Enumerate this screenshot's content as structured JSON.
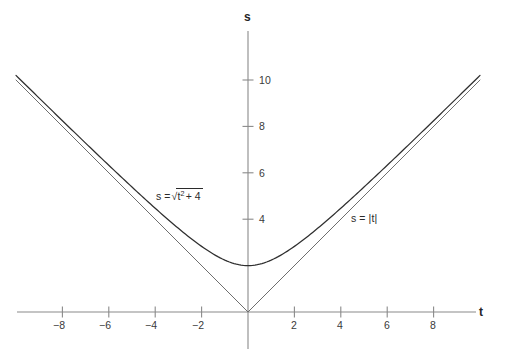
{
  "chart_data": {
    "type": "line",
    "title": "",
    "xlabel": "t",
    "ylabel": "s",
    "xlim": [
      -10,
      10.4
    ],
    "ylim": [
      -0.9,
      12.3
    ],
    "grid": false,
    "legend_position": "inline-annotations",
    "xticks": [
      -8,
      -6,
      -4,
      -2,
      2,
      4,
      6,
      8
    ],
    "xtick_labels": [
      "−8",
      "−6",
      "−4",
      "−2",
      "2",
      "4",
      "6",
      "8"
    ],
    "yticks": [
      4,
      6,
      8,
      10
    ],
    "ytick_labels": [
      "4",
      "6",
      "8",
      "10"
    ],
    "series": [
      {
        "name": "s = √(t² + 4)",
        "label_text_parts": {
          "lhs": "s =",
          "radicand_base": "t",
          "radicand_exponent": "2",
          "radicand_rest": "+ 4"
        },
        "color": "#2f2f2f",
        "x": [
          -10,
          -9.5,
          -9,
          -8.5,
          -8,
          -7.5,
          -7,
          -6.5,
          -6,
          -5.5,
          -5,
          -4.5,
          -4,
          -3.5,
          -3,
          -2.5,
          -2,
          -1.5,
          -1,
          -0.5,
          0,
          0.5,
          1,
          1.5,
          2,
          2.5,
          3,
          3.5,
          4,
          4.5,
          5,
          5.5,
          6,
          6.5,
          7,
          7.5,
          8,
          8.5,
          9,
          9.5,
          10
        ],
        "values": [
          10.198,
          9.708,
          9.22,
          8.732,
          8.246,
          7.762,
          7.28,
          6.801,
          6.325,
          5.852,
          5.385,
          4.924,
          4.472,
          4.031,
          3.606,
          3.202,
          2.828,
          2.5,
          2.236,
          2.062,
          2.0,
          2.062,
          2.236,
          2.5,
          2.828,
          3.202,
          3.606,
          4.031,
          4.472,
          4.924,
          5.385,
          5.852,
          6.325,
          6.801,
          7.28,
          7.762,
          8.246,
          8.732,
          9.22,
          9.708,
          10.198
        ]
      },
      {
        "name": "s = |t|",
        "label_text": "s = |t|",
        "color": "#6e6e6e",
        "x": [
          -10,
          -8,
          -6,
          -4,
          -2,
          0,
          2,
          4,
          6,
          8,
          10
        ],
        "values": [
          10,
          8,
          6,
          4,
          2,
          0,
          2,
          4,
          6,
          8,
          10
        ]
      }
    ],
    "annotations": [
      {
        "text": "s = √(t² + 4)",
        "x": -4.1,
        "y": 4.9
      },
      {
        "text": "s = |t|",
        "x": 4.0,
        "y": 4.0
      }
    ],
    "minimum_point": {
      "t": 0,
      "s": 2
    },
    "asymptote_note": "s = √(t² + 4) approaches s = |t| as |t| → ∞"
  },
  "axes": {
    "x_axis_title": "t",
    "y_axis_title": "s"
  },
  "labels": {
    "curve1": {
      "lhs": "s =",
      "var": "t",
      "exp": "2",
      "rest": "+ 4"
    },
    "curve2": "s = |t|"
  },
  "xtick_labels": [
    "−8",
    "−6",
    "−4",
    "−2",
    "2",
    "4",
    "6",
    "8"
  ],
  "ytick_labels": [
    "4",
    "6",
    "8",
    "10"
  ],
  "colors": {
    "curve_sqrt": "#2f2f2f",
    "curve_abs": "#6e6e6e",
    "axis": "#8a8a8a",
    "text": "#2b2b2b",
    "background": "#ffffff"
  }
}
